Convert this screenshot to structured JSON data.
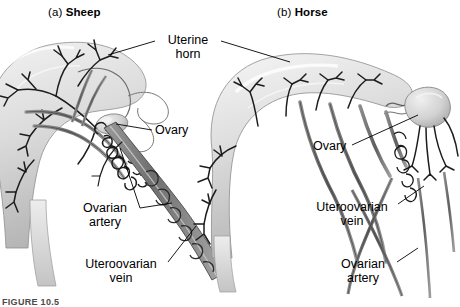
{
  "figure": {
    "caption_partial": "FIGURE 10.5",
    "background_color": "#ffffff",
    "ink_color": "#000000",
    "tissue_fill_color": "#d9d9d9",
    "vessel_color": "#6e6e6e",
    "style": "grayscale anatomical line illustration"
  },
  "panels": [
    {
      "id": "sheep",
      "letter": "(a)",
      "name": "Sheep",
      "title_full": "(a) Sheep"
    },
    {
      "id": "horse",
      "letter": "(b)",
      "name": "Horse",
      "title_full": "(b) Horse"
    }
  ],
  "labels": {
    "uterine_horn": {
      "line1": "Uterine",
      "line2": "horn",
      "text": "Uterine horn",
      "shared_by_both_panels": true
    },
    "ovary_sheep": {
      "text": "Ovary"
    },
    "ovarian_artery_sheep": {
      "line1": "Ovarian",
      "line2": "artery",
      "text": "Ovarian artery"
    },
    "uteroovarian_vein_sheep": {
      "line1": "Uteroovarian",
      "line2": "vein",
      "text": "Uteroovarian vein"
    },
    "ovary_horse": {
      "text": "Ovary"
    },
    "uteroovarian_vein_horse": {
      "line1": "Uteroovarian",
      "line2": "vein",
      "text": "Uteroovarian vein"
    },
    "ovarian_artery_horse": {
      "line1": "Ovarian",
      "line2": "artery",
      "text": "Ovarian artery"
    }
  }
}
